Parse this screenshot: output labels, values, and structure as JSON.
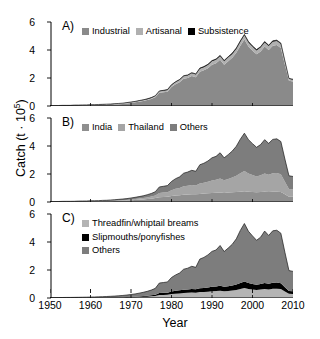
{
  "chart_data": {
    "type": "area",
    "title": "",
    "xlabel": "Year",
    "ylabel": "Catch (t · 10⁵)",
    "ylabel_text": "Catch (t · 10",
    "ylabel_exp": "5",
    "ylabel_close": ")",
    "xlim": [
      1950,
      2010
    ],
    "ylim": [
      0,
      6
    ],
    "yticks": [
      0,
      2,
      4,
      6
    ],
    "xticks": [
      1950,
      1960,
      1970,
      1980,
      1990,
      2000,
      2010
    ],
    "grid": false,
    "stacked": true,
    "legend_position": "inside-top-left",
    "colors": {
      "light_gray": "#b8b8b8",
      "mid_gray": "#8a8a8a",
      "dark_gray": "#6e6e6e",
      "black": "#000000",
      "axis": "#000000",
      "background": "#ffffff"
    },
    "x": [
      1950,
      1951,
      1952,
      1953,
      1954,
      1955,
      1956,
      1957,
      1958,
      1959,
      1960,
      1961,
      1962,
      1963,
      1964,
      1965,
      1966,
      1967,
      1968,
      1969,
      1970,
      1971,
      1972,
      1973,
      1974,
      1975,
      1976,
      1977,
      1978,
      1979,
      1980,
      1981,
      1982,
      1983,
      1984,
      1985,
      1986,
      1987,
      1988,
      1989,
      1990,
      1991,
      1992,
      1993,
      1994,
      1995,
      1996,
      1997,
      1998,
      1999,
      2000,
      2001,
      2002,
      2003,
      2004,
      2005,
      2006,
      2007,
      2008,
      2009,
      2010
    ],
    "panels": [
      {
        "tag": "A)",
        "legend_layout": "inline",
        "series": [
          {
            "name": "Industrial",
            "color": "#8a8a8a",
            "values": [
              0.02,
              0.02,
              0.02,
              0.03,
              0.03,
              0.03,
              0.04,
              0.04,
              0.05,
              0.05,
              0.06,
              0.06,
              0.07,
              0.08,
              0.09,
              0.1,
              0.11,
              0.13,
              0.15,
              0.18,
              0.22,
              0.26,
              0.31,
              0.36,
              0.42,
              0.5,
              0.62,
              0.95,
              0.98,
              1.02,
              1.35,
              1.55,
              1.7,
              1.95,
              2.0,
              2.15,
              2.05,
              2.45,
              2.55,
              2.7,
              2.95,
              3.05,
              3.3,
              2.95,
              3.2,
              3.45,
              3.8,
              4.3,
              4.75,
              4.25,
              3.95,
              3.7,
              3.9,
              4.25,
              4.0,
              4.3,
              4.35,
              4.15,
              2.95,
              1.8,
              1.75
            ]
          },
          {
            "name": "Artisanal",
            "color": "#b0b0b0",
            "values": [
              0.01,
              0.01,
              0.01,
              0.01,
              0.01,
              0.01,
              0.02,
              0.02,
              0.02,
              0.02,
              0.02,
              0.02,
              0.03,
              0.03,
              0.03,
              0.03,
              0.04,
              0.04,
              0.04,
              0.05,
              0.05,
              0.05,
              0.06,
              0.06,
              0.07,
              0.08,
              0.09,
              0.1,
              0.11,
              0.12,
              0.14,
              0.15,
              0.16,
              0.17,
              0.18,
              0.19,
              0.2,
              0.21,
              0.22,
              0.23,
              0.24,
              0.25,
              0.26,
              0.25,
              0.26,
              0.27,
              0.28,
              0.29,
              0.3,
              0.29,
              0.28,
              0.27,
              0.28,
              0.29,
              0.28,
              0.29,
              0.29,
              0.28,
              0.22,
              0.14,
              0.13
            ]
          },
          {
            "name": "Subsistence",
            "color": "#000000",
            "values": [
              0.004,
              0.004,
              0.004,
              0.005,
              0.005,
              0.005,
              0.006,
              0.006,
              0.006,
              0.007,
              0.007,
              0.008,
              0.008,
              0.009,
              0.01,
              0.011,
              0.012,
              0.013,
              0.014,
              0.015,
              0.016,
              0.017,
              0.018,
              0.019,
              0.02,
              0.022,
              0.024,
              0.026,
              0.028,
              0.03,
              0.032,
              0.034,
              0.036,
              0.038,
              0.04,
              0.042,
              0.044,
              0.046,
              0.048,
              0.05,
              0.052,
              0.054,
              0.056,
              0.054,
              0.056,
              0.058,
              0.06,
              0.062,
              0.064,
              0.062,
              0.06,
              0.058,
              0.06,
              0.062,
              0.06,
              0.062,
              0.062,
              0.06,
              0.048,
              0.032,
              0.03
            ]
          }
        ]
      },
      {
        "tag": "B)",
        "legend_layout": "inline",
        "series": [
          {
            "name": "India",
            "color": "#8f8f8f",
            "values": [
              0.01,
              0.01,
              0.01,
              0.02,
              0.02,
              0.02,
              0.02,
              0.03,
              0.03,
              0.03,
              0.04,
              0.04,
              0.04,
              0.05,
              0.05,
              0.06,
              0.07,
              0.08,
              0.09,
              0.1,
              0.12,
              0.14,
              0.16,
              0.18,
              0.21,
              0.24,
              0.28,
              0.34,
              0.36,
              0.38,
              0.42,
              0.46,
              0.48,
              0.52,
              0.54,
              0.56,
              0.55,
              0.58,
              0.6,
              0.62,
              0.64,
              0.66,
              0.68,
              0.65,
              0.67,
              0.7,
              0.72,
              0.74,
              0.76,
              0.74,
              0.72,
              0.7,
              0.72,
              0.74,
              0.72,
              0.74,
              0.74,
              0.72,
              0.55,
              0.38,
              0.37
            ]
          },
          {
            "name": "Thailand",
            "color": "#a5a5a5",
            "values": [
              0.005,
              0.005,
              0.006,
              0.006,
              0.007,
              0.007,
              0.008,
              0.009,
              0.01,
              0.011,
              0.012,
              0.013,
              0.015,
              0.017,
              0.02,
              0.023,
              0.027,
              0.032,
              0.038,
              0.045,
              0.055,
              0.068,
              0.082,
              0.1,
              0.12,
              0.15,
              0.19,
              0.3,
              0.31,
              0.32,
              0.42,
              0.48,
              0.52,
              0.6,
              0.62,
              0.66,
              0.63,
              0.75,
              0.78,
              0.83,
              0.9,
              0.93,
              1.0,
              0.9,
              0.97,
              1.05,
              1.16,
              1.32,
              1.45,
              1.3,
              1.21,
              1.13,
              1.19,
              1.3,
              1.22,
              1.31,
              1.33,
              1.27,
              0.9,
              0.55,
              0.53
            ]
          },
          {
            "name": "Others",
            "color": "#7d7d7d",
            "values": [
              0.015,
              0.016,
              0.017,
              0.019,
              0.02,
              0.021,
              0.024,
              0.026,
              0.029,
              0.031,
              0.035,
              0.037,
              0.043,
              0.049,
              0.053,
              0.06,
              0.067,
              0.077,
              0.086,
              0.1,
              0.111,
              0.125,
              0.142,
              0.161,
              0.187,
              0.218,
              0.264,
              0.436,
              0.451,
              0.47,
              0.628,
              0.725,
              0.796,
              0.938,
              0.98,
              1.042,
              1.014,
              1.331,
              1.39,
              1.48,
              1.618,
              1.669,
              1.836,
              1.604,
              1.743,
              1.888,
              2.1,
              2.428,
              2.704,
              2.412,
              2.238,
              2.078,
              2.19,
              2.412,
              2.248,
              2.422,
              2.442,
              2.33,
              1.618,
              0.942,
              0.923
            ]
          }
        ]
      },
      {
        "tag": "C)",
        "legend_layout": "stacked",
        "series": [
          {
            "name": "Threadfin/whiptail breams",
            "color": "#b4b4b4",
            "values": [
              0.004,
              0.004,
              0.005,
              0.005,
              0.006,
              0.006,
              0.007,
              0.008,
              0.009,
              0.01,
              0.011,
              0.012,
              0.014,
              0.016,
              0.018,
              0.021,
              0.024,
              0.028,
              0.033,
              0.039,
              0.047,
              0.056,
              0.068,
              0.081,
              0.097,
              0.117,
              0.142,
              0.215,
              0.222,
              0.23,
              0.28,
              0.31,
              0.33,
              0.36,
              0.37,
              0.39,
              0.375,
              0.42,
              0.435,
              0.455,
              0.48,
              0.495,
              0.525,
              0.48,
              0.505,
              0.535,
              0.58,
              0.65,
              0.71,
              0.645,
              0.605,
              0.57,
              0.6,
              0.65,
              0.615,
              0.655,
              0.665,
              0.64,
              0.47,
              0.3,
              0.29
            ]
          },
          {
            "name": "Slipmouths/ponyfishes",
            "color": "#000000",
            "values": [
              0.003,
              0.003,
              0.003,
              0.004,
              0.004,
              0.004,
              0.005,
              0.005,
              0.006,
              0.006,
              0.007,
              0.008,
              0.009,
              0.01,
              0.012,
              0.014,
              0.016,
              0.019,
              0.022,
              0.026,
              0.031,
              0.037,
              0.045,
              0.053,
              0.064,
              0.077,
              0.093,
              0.14,
              0.145,
              0.15,
              0.18,
              0.2,
              0.215,
              0.235,
              0.24,
              0.255,
              0.245,
              0.275,
              0.285,
              0.3,
              0.315,
              0.325,
              0.345,
              0.315,
              0.33,
              0.35,
              0.38,
              0.425,
              0.465,
              0.42,
              0.395,
              0.372,
              0.392,
              0.425,
              0.402,
              0.428,
              0.435,
              0.418,
              0.305,
              0.195,
              0.19
            ]
          },
          {
            "name": "Others",
            "color": "#7d7d7d",
            "values": [
              0.023,
              0.024,
              0.025,
              0.027,
              0.029,
              0.031,
              0.034,
              0.037,
              0.041,
              0.044,
              0.05,
              0.054,
              0.061,
              0.069,
              0.077,
              0.087,
              0.098,
              0.112,
              0.127,
              0.147,
              0.17,
              0.199,
              0.231,
              0.27,
              0.313,
              0.372,
              0.453,
              0.715,
              0.738,
              0.765,
              1.005,
              1.135,
              1.24,
              1.46,
              1.52,
              1.62,
              1.57,
              2.085,
              2.18,
              2.325,
              2.535,
              2.61,
              2.88,
              2.525,
              2.73,
              2.95,
              3.265,
              3.755,
              4.145,
              3.7,
              3.435,
              3.18,
              3.35,
              3.705,
              3.45,
              3.715,
              3.74,
              3.57,
              2.49,
              1.465,
              1.42
            ]
          }
        ]
      }
    ]
  },
  "axis": {
    "ytick_labels": [
      "6",
      "4",
      "2",
      "0"
    ],
    "xtick_labels": [
      "1950",
      "1960",
      "1970",
      "1980",
      "1990",
      "2000",
      "2010"
    ]
  },
  "panel_a": {
    "tag": "A)",
    "legend": [
      {
        "label": "Industrial",
        "swatch": "#8a8a8a"
      },
      {
        "label": "Artisanal",
        "swatch": "#b0b0b0"
      },
      {
        "label": "Subsistence",
        "swatch": "#000000"
      }
    ]
  },
  "panel_b": {
    "tag": "B)",
    "legend": [
      {
        "label": "India",
        "swatch": "#8f8f8f"
      },
      {
        "label": "Thailand",
        "swatch": "#a5a5a5"
      },
      {
        "label": "Others",
        "swatch": "#7d7d7d"
      }
    ]
  },
  "panel_c": {
    "tag": "C)",
    "legend": [
      {
        "label": "Threadfin/whiptail breams",
        "swatch": "#b4b4b4"
      },
      {
        "label": "Slipmouths/ponyfishes",
        "swatch": "#000000"
      },
      {
        "label": "Others",
        "swatch": "#7d7d7d"
      }
    ]
  }
}
